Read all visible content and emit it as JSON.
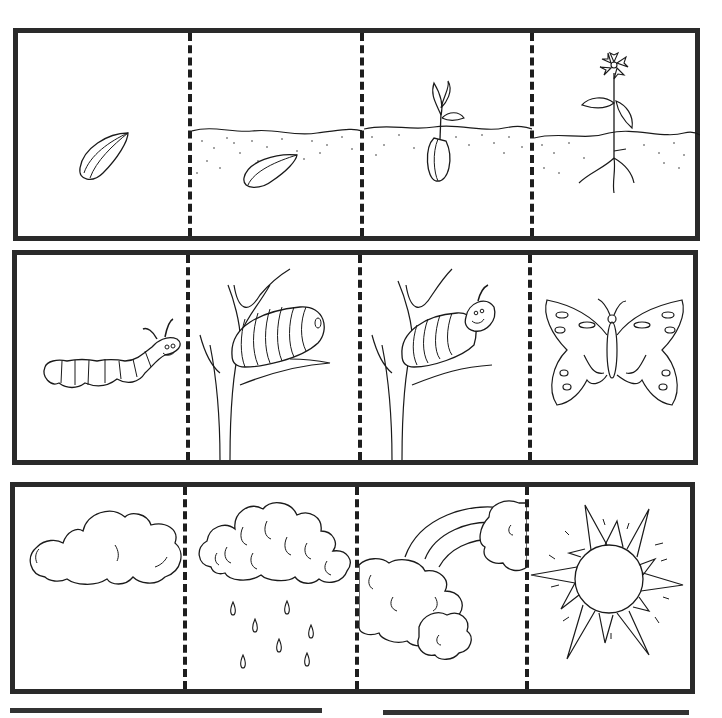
{
  "worksheet": {
    "type": "sequencing-cut-and-paste",
    "rows": [
      {
        "topic": "plant-life-cycle",
        "panels": [
          {
            "image": "seed"
          },
          {
            "image": "seed-in-soil"
          },
          {
            "image": "sprouting-seed"
          },
          {
            "image": "flowering-plant"
          }
        ]
      },
      {
        "topic": "butterfly-life-cycle",
        "panels": [
          {
            "image": "caterpillar"
          },
          {
            "image": "cocoon-on-branch"
          },
          {
            "image": "caterpillar-emerging-from-cocoon"
          },
          {
            "image": "butterfly"
          }
        ]
      },
      {
        "topic": "weather-sequence",
        "panels": [
          {
            "image": "cloud"
          },
          {
            "image": "rain-cloud"
          },
          {
            "image": "rainbow-with-clouds"
          },
          {
            "image": "sun"
          }
        ]
      }
    ],
    "answer_lines": [
      {
        "label": ""
      },
      {
        "label": ""
      }
    ],
    "colors": {
      "frame": "#2a2a2a",
      "ink": "#1a1a1a",
      "paper": "#ffffff"
    }
  }
}
